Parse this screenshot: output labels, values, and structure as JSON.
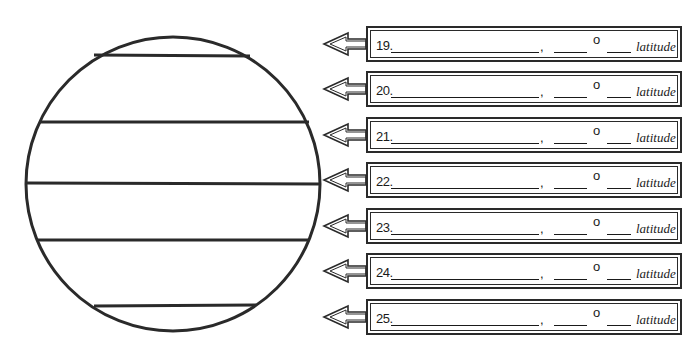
{
  "diagram": {
    "globe": {
      "center": [
        173,
        184
      ],
      "radius": 147,
      "line_y": [
        56,
        122,
        183,
        240,
        306
      ],
      "stroke_color": "#2a2a2a"
    },
    "answer_rows": [
      {
        "number": "19.",
        "comma": ",",
        "degree_symbol": "o",
        "suffix": "latitude"
      },
      {
        "number": "20.",
        "comma": ",",
        "degree_symbol": "o",
        "suffix": "latitude"
      },
      {
        "number": "21.",
        "comma": ",",
        "degree_symbol": "o",
        "suffix": "latitude"
      },
      {
        "number": "22.",
        "comma": ",",
        "degree_symbol": "o",
        "suffix": "latitude"
      },
      {
        "number": "23.",
        "comma": ",",
        "degree_symbol": "o",
        "suffix": "latitude"
      },
      {
        "number": "24.",
        "comma": ",",
        "degree_symbol": "o",
        "suffix": "latitude"
      },
      {
        "number": "25.",
        "comma": ",",
        "degree_symbol": "o",
        "suffix": "latitude"
      }
    ],
    "row_top_y": [
      26,
      71,
      117,
      162,
      208,
      253,
      299
    ]
  }
}
